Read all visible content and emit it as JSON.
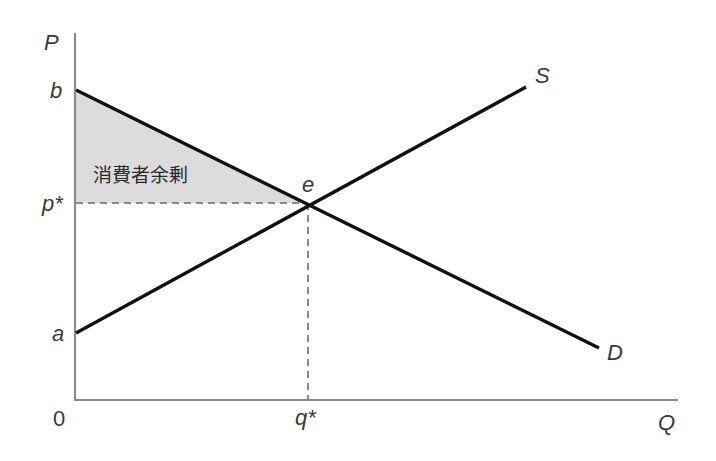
{
  "diagram": {
    "type": "supply-demand",
    "axes": {
      "y_label": "P",
      "x_label": "Q",
      "origin_label": "0"
    },
    "price_labels": {
      "b": "b",
      "p_star": "p*",
      "a": "a"
    },
    "quantity_labels": {
      "q_star": "q*"
    },
    "curves": [
      {
        "name": "S",
        "label": "S",
        "from": "a",
        "to": "upper-right",
        "slope": "positive"
      },
      {
        "name": "D",
        "label": "D",
        "from": "b",
        "to": "lower-right",
        "slope": "negative"
      }
    ],
    "equilibrium": {
      "label": "e",
      "price": "p*",
      "quantity": "q*"
    },
    "shaded_region": {
      "label": "消費者余剰",
      "meaning": "consumer surplus",
      "vertices": [
        "b",
        "e",
        "p*"
      ],
      "color": "#dcdcdc"
    },
    "colors": {
      "axis": "#8a8a8a",
      "curve": "#111111",
      "guide": "#8a8a8a",
      "shade": "#dcdcdc",
      "text": "#3a3a3a"
    }
  }
}
